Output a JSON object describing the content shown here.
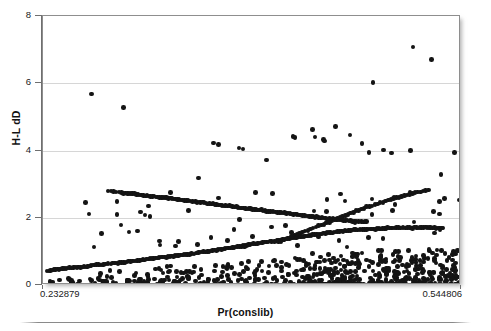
{
  "axes": {
    "y_title": "H-L dD",
    "x_title": "Pr(conslib)",
    "y_ticks": [
      "0",
      "2",
      "4",
      "6",
      "8"
    ],
    "y_tick_values": [
      0,
      2,
      4,
      6,
      8
    ],
    "x_tick_labels": [
      "0.232879",
      "0.544806"
    ],
    "y_min": 0,
    "y_max": 8,
    "x_min": 0.232879,
    "x_max": 0.544806
  },
  "style": {
    "point_color": "#141414",
    "grid_color": "#d6d6d6",
    "frame_color": "#8e8e8e",
    "axis_color": "#6f6f6f",
    "background": "#ffffff"
  },
  "chart_data": {
    "type": "scatter",
    "title": "",
    "xlabel": "Pr(conslib)",
    "ylabel": "H-L dD",
    "xlim": [
      0.232879,
      0.544806
    ],
    "ylim": [
      0,
      8
    ],
    "ytick_values": [
      0,
      2,
      4,
      6,
      8
    ],
    "grid": "horizontal gridlines at y = 2, 4, 6",
    "legend": "none",
    "marker": "filled circle, black, small",
    "n_points": 620,
    "series": [
      {
        "name": "descending-band",
        "x": [
          0.2815,
          0.2835,
          0.2855,
          0.2875,
          0.2895,
          0.2915,
          0.2945,
          0.2985,
          0.3025,
          0.3065,
          0.3105,
          0.3145,
          0.3185,
          0.3225,
          0.3265,
          0.3305,
          0.3345,
          0.3385,
          0.3425,
          0.3465,
          0.3505,
          0.3545,
          0.3585,
          0.3625,
          0.3665,
          0.3705,
          0.3745,
          0.3785,
          0.3825,
          0.3865,
          0.3905,
          0.3945,
          0.3985,
          0.4025,
          0.4065,
          0.4105,
          0.4145,
          0.4185,
          0.4225,
          0.4265,
          0.4305,
          0.4345,
          0.4385,
          0.4425,
          0.4465,
          0.4505,
          0.4545,
          0.4585,
          0.4625,
          0.4665,
          0.4705,
          0.4745
        ],
        "y": [
          2.8,
          2.79,
          2.78,
          2.77,
          2.76,
          2.75,
          2.73,
          2.72,
          2.7,
          2.68,
          2.66,
          2.64,
          2.62,
          2.6,
          2.58,
          2.56,
          2.54,
          2.52,
          2.5,
          2.48,
          2.46,
          2.44,
          2.41,
          2.39,
          2.37,
          2.35,
          2.33,
          2.31,
          2.29,
          2.27,
          2.25,
          2.23,
          2.21,
          2.19,
          2.17,
          2.15,
          2.13,
          2.11,
          2.09,
          2.07,
          2.05,
          2.03,
          2.01,
          1.99,
          1.97,
          1.95,
          1.94,
          1.92,
          1.91,
          1.9,
          1.89,
          1.88
        ]
      },
      {
        "name": "lower-ascending-band",
        "x": [
          0.236,
          0.2385,
          0.241,
          0.2435,
          0.246,
          0.2485,
          0.2515,
          0.2555,
          0.2595,
          0.2635,
          0.2675,
          0.2715,
          0.2755,
          0.2795,
          0.2835,
          0.2875,
          0.2915,
          0.2955,
          0.2995,
          0.3035,
          0.3075,
          0.3115,
          0.3155,
          0.3195,
          0.3235,
          0.3275,
          0.3315,
          0.3355,
          0.3395,
          0.3435,
          0.3475,
          0.3515,
          0.3555,
          0.3595,
          0.3635,
          0.3675,
          0.3715,
          0.3755,
          0.3795,
          0.3835,
          0.3875,
          0.3915,
          0.3955,
          0.3995,
          0.4035,
          0.4075,
          0.4115,
          0.4155,
          0.4195,
          0.4235,
          0.4275,
          0.4315,
          0.4355,
          0.4395,
          0.4435,
          0.4475,
          0.4515,
          0.4555,
          0.4595,
          0.4635,
          0.4675,
          0.4715,
          0.4755,
          0.4795,
          0.4835,
          0.4875,
          0.4915,
          0.4955,
          0.4995,
          0.5035,
          0.5075,
          0.5115,
          0.5155,
          0.5195,
          0.5235,
          0.5275,
          0.5315
        ],
        "y": [
          0.42,
          0.44,
          0.46,
          0.47,
          0.48,
          0.49,
          0.5,
          0.52,
          0.54,
          0.55,
          0.57,
          0.59,
          0.6,
          0.62,
          0.63,
          0.65,
          0.67,
          0.69,
          0.71,
          0.73,
          0.75,
          0.77,
          0.79,
          0.81,
          0.83,
          0.85,
          0.87,
          0.89,
          0.91,
          0.93,
          0.95,
          0.98,
          1.0,
          1.02,
          1.05,
          1.07,
          1.1,
          1.12,
          1.15,
          1.17,
          1.2,
          1.22,
          1.25,
          1.28,
          1.3,
          1.33,
          1.35,
          1.38,
          1.4,
          1.43,
          1.45,
          1.47,
          1.5,
          1.52,
          1.54,
          1.56,
          1.58,
          1.6,
          1.61,
          1.63,
          1.64,
          1.65,
          1.66,
          1.67,
          1.68,
          1.68,
          1.69,
          1.69,
          1.7,
          1.7,
          1.7,
          1.71,
          1.71,
          1.71,
          1.7,
          1.7,
          1.69
        ]
      },
      {
        "name": "upper-ascending-band",
        "x": [
          0.4085,
          0.4125,
          0.4165,
          0.4205,
          0.4245,
          0.4285,
          0.4325,
          0.4365,
          0.4405,
          0.4445,
          0.4485,
          0.4525,
          0.4565,
          0.4605,
          0.4645,
          0.4685,
          0.4725,
          0.4765,
          0.4805,
          0.4845,
          0.4885,
          0.4925,
          0.4965,
          0.5005,
          0.5045,
          0.5085,
          0.5125,
          0.5165,
          0.5205
        ],
        "y": [
          1.28,
          1.34,
          1.4,
          1.47,
          1.53,
          1.6,
          1.66,
          1.72,
          1.79,
          1.85,
          1.91,
          1.98,
          2.04,
          2.1,
          2.16,
          2.22,
          2.28,
          2.34,
          2.4,
          2.45,
          2.5,
          2.55,
          2.6,
          2.64,
          2.68,
          2.72,
          2.76,
          2.79,
          2.82
        ]
      },
      {
        "name": "scatter-cluster-low",
        "x": [
          0.238,
          0.245,
          0.252,
          0.26,
          0.268,
          0.276,
          0.284,
          0.29,
          0.296,
          0.301,
          0.306,
          0.311,
          0.316,
          0.321,
          0.326,
          0.331,
          0.336,
          0.341,
          0.346,
          0.351,
          0.356,
          0.361,
          0.366,
          0.371,
          0.376,
          0.381,
          0.386,
          0.391,
          0.396,
          0.401,
          0.406,
          0.411,
          0.416,
          0.421,
          0.426,
          0.431,
          0.436,
          0.441,
          0.446,
          0.451,
          0.456,
          0.461,
          0.466,
          0.471,
          0.476,
          0.481,
          0.486,
          0.491,
          0.496,
          0.501,
          0.506,
          0.511,
          0.516,
          0.521,
          0.526,
          0.531,
          0.536,
          0.54,
          0.543
        ],
        "y": [
          0.1,
          0.15,
          0.2,
          0.12,
          0.18,
          0.35,
          0.22,
          0.4,
          0.14,
          0.28,
          0.08,
          0.32,
          0.18,
          0.45,
          0.24,
          0.12,
          0.38,
          0.2,
          0.55,
          0.3,
          0.16,
          0.42,
          0.25,
          0.6,
          0.35,
          0.18,
          0.48,
          0.28,
          0.7,
          0.38,
          0.22,
          0.52,
          0.32,
          0.8,
          0.45,
          0.25,
          0.58,
          0.36,
          0.9,
          0.5,
          0.28,
          0.64,
          0.4,
          0.95,
          0.55,
          0.3,
          0.7,
          0.44,
          1.0,
          0.6,
          0.34,
          0.76,
          0.48,
          1.05,
          0.65,
          0.38,
          0.82,
          0.52,
          0.24
        ]
      },
      {
        "name": "high-outliers",
        "x": [
          0.269,
          0.293,
          0.36,
          0.364,
          0.379,
          0.382,
          0.3995,
          0.4195,
          0.421,
          0.434,
          0.436,
          0.442,
          0.443,
          0.451,
          0.462,
          0.471,
          0.476,
          0.487,
          0.493,
          0.509,
          0.523,
          0.54,
          0.309,
          0.349,
          0.288,
          0.404,
          0.479,
          0.507,
          0.53
        ],
        "y": [
          5.68,
          5.28,
          4.22,
          4.18,
          4.08,
          4.04,
          3.72,
          4.42,
          4.38,
          4.62,
          4.4,
          4.32,
          4.28,
          4.72,
          4.46,
          4.2,
          3.94,
          4.02,
          3.92,
          7.08,
          6.7,
          3.94,
          2.08,
          3.18,
          2.1,
          2.72,
          6.02,
          4.0,
          3.28
        ]
      }
    ]
  }
}
